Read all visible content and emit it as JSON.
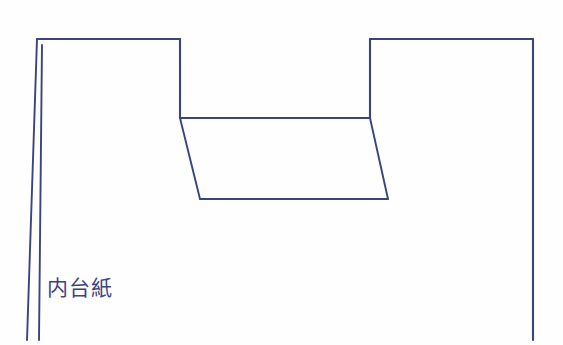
{
  "diagram": {
    "title": "内台紙",
    "line_color": "#3b4480",
    "background_color": "#fefefe",
    "canvas": {
      "width": 563,
      "height": 345
    }
  },
  "labels": {
    "inner_mount": "内台紙"
  },
  "geometry": {
    "top_left_segment": "M 37 39 L 180 39",
    "top_right_segment": "M 370 39 L 533 39",
    "notch_left_vertical": "M 180 39 L 180 118",
    "notch_right_vertical": "M 370 39 L 370 118",
    "notch_top_horizontal": "M 180 118 L 370 118",
    "trapezoid_left_slant": "M 180 118 L 200 199",
    "trapezoid_right_slant": "M 370 118 L 388 199",
    "trapezoid_bottom": "M 200 199 L 388 199",
    "left_edge_outer": "M 37 39 L 27 340",
    "left_edge_inner": "M 42 45 L 39 340",
    "right_edge": "M 533 39 L 533 340"
  }
}
